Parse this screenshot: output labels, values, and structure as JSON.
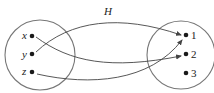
{
  "diagram": {
    "relation_label": "H",
    "domain_set": {
      "elements": [
        {
          "label": "x",
          "x": 31,
          "y": 36
        },
        {
          "label": "y",
          "x": 31,
          "y": 54
        },
        {
          "label": "z",
          "x": 31,
          "y": 72
        }
      ]
    },
    "codomain_set": {
      "elements": [
        {
          "label": "1",
          "x": 185,
          "y": 35
        },
        {
          "label": "2",
          "x": 185,
          "y": 54
        },
        {
          "label": "3",
          "x": 185,
          "y": 73
        }
      ]
    },
    "mappings": [
      {
        "from": "x",
        "to": "2"
      },
      {
        "from": "y",
        "to": "1"
      },
      {
        "from": "z",
        "to": "1"
      }
    ],
    "colors": {
      "circle": "#777777",
      "arrow": "#444444",
      "dot": "#1a1a1a",
      "text": "#222222"
    }
  }
}
